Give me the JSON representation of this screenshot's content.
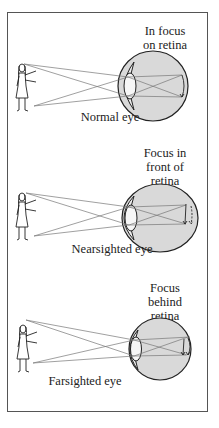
{
  "panels": [
    {
      "id": "normal",
      "focus_label_lines": [
        "In focus",
        "on retina"
      ],
      "caption": "Normal eye"
    },
    {
      "id": "nearsighted",
      "focus_label_lines": [
        "Focus in",
        "front of",
        "retina"
      ],
      "caption": "Nearsighted eye"
    },
    {
      "id": "farsighted",
      "focus_label_lines": [
        "Focus",
        "behind",
        "retina"
      ],
      "caption": "Farsighted eye"
    }
  ],
  "colors": {
    "eyeball_fill": "#d9d9d9",
    "outline": "#222222",
    "rays": "#777777",
    "frame": "#555555"
  }
}
